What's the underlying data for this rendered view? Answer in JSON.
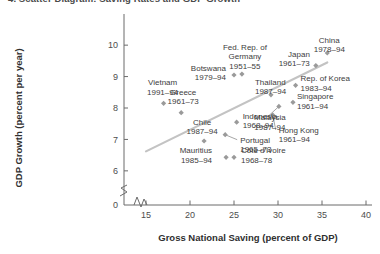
{
  "title": "4. Scatter Diagram: Saving Rates and GDP Growth",
  "chart_data": {
    "type": "scatter",
    "title": "4. Scatter Diagram: Saving Rates and GDP Growth",
    "xlabel": "Gross National Saving (percent of GDP)",
    "ylabel": "GDP Growth (percent per year)",
    "xlim": [
      12.5,
      40
    ],
    "ylim": [
      5.55,
      10.45
    ],
    "xticks": [
      15,
      20,
      25,
      30,
      35,
      40
    ],
    "yticks": [
      0,
      6,
      7,
      8,
      9,
      10
    ],
    "grid": false,
    "legend": "none",
    "axis_break_x": true,
    "axis_break_y": true,
    "trendline": {
      "x0": 15.0,
      "y0": 6.62,
      "x1": 35.6,
      "y1": 9.45
    },
    "points": [
      {
        "name": "Vietnam",
        "period": "1991–94",
        "x": 17.0,
        "y": 8.15,
        "label_dx": -1,
        "label_dy": -18,
        "label_align": "middle",
        "leader": false
      },
      {
        "name": "Greece",
        "period": "1961–73",
        "x": 19.0,
        "y": 7.85,
        "label_dx": 2,
        "label_dy": -18,
        "label_align": "middle",
        "leader": false
      },
      {
        "name": "Chile",
        "period": "1987–94",
        "x": 21.6,
        "y": 6.95,
        "label_dx": -2,
        "label_dy": -16,
        "label_align": "middle",
        "leader": false
      },
      {
        "name": "Mauritius",
        "period": "1985–94",
        "x": 24.1,
        "y": 6.43,
        "label_dx": -14,
        "label_dy": -4,
        "label_align": "end",
        "leader": false
      },
      {
        "name": "Côte d'Ivoire",
        "period": "1968–78",
        "x": 25.0,
        "y": 6.43,
        "label_dx": 7,
        "label_dy": -4,
        "label_align": "start",
        "leader": false
      },
      {
        "name": "Portugal",
        "period": "1965–73",
        "x": 24.0,
        "y": 7.15,
        "label_dx": 15,
        "label_dy": 8,
        "label_align": "start",
        "leader": true
      },
      {
        "name": "Indonesia",
        "period": "1968–94",
        "x": 25.3,
        "y": 7.55,
        "label_dx": 6,
        "label_dy": -3,
        "label_align": "start",
        "leader": false
      },
      {
        "name": "Botswana",
        "period": "1979–94",
        "x": 25.0,
        "y": 9.05,
        "label_dx": -8,
        "label_dy": -4,
        "label_align": "end",
        "leader": false
      },
      {
        "name": "Fed. Rep. of Germany",
        "period": "1951–55",
        "x": 25.9,
        "y": 9.08,
        "label_dx": 3,
        "label_dy": -24,
        "label_align": "middle",
        "leader": false
      },
      {
        "name": "Thailand",
        "period": "1987–94",
        "x": 29.2,
        "y": 8.42,
        "label_dx": -16,
        "label_dy": -10,
        "label_align": "start",
        "leader": false
      },
      {
        "name": "Malaysia",
        "period": "1987–94",
        "x": 30.1,
        "y": 8.05,
        "label_dx": -9,
        "label_dy": 14,
        "label_align": "middle",
        "leader": true
      },
      {
        "name": "Hong Kong",
        "period": "1961–94",
        "x": 29.4,
        "y": 7.78,
        "label_dx": 6,
        "label_dy": 18,
        "label_align": "start",
        "leader": true
      },
      {
        "name": "Singapore",
        "period": "1961–94",
        "x": 31.7,
        "y": 8.18,
        "label_dx": 4,
        "label_dy": -3,
        "label_align": "start",
        "leader": false
      },
      {
        "name": "Rep. of Korea",
        "period": "1983–94",
        "x": 32.0,
        "y": 8.72,
        "label_dx": 5,
        "label_dy": -4,
        "label_align": "start",
        "leader": false
      },
      {
        "name": "Japan",
        "period": "1961–73",
        "x": 34.3,
        "y": 9.35,
        "label_dx": -6,
        "label_dy": -9,
        "label_align": "end",
        "leader": false
      },
      {
        "name": "China",
        "period": "1978–94",
        "x": 35.6,
        "y": 9.75,
        "label_dx": 2,
        "label_dy": -10,
        "label_align": "middle",
        "leader": false
      }
    ]
  }
}
